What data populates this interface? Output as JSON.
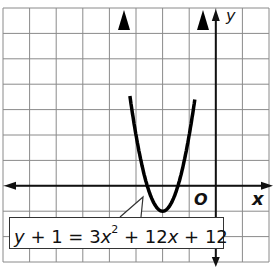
{
  "chart_data": {
    "type": "line",
    "title": "",
    "xlabel": "x",
    "ylabel": "y",
    "origin_label": "O",
    "equation": "y + 1 = 3x^2 + 12x + 12",
    "function": "y = 3x^2 + 12x + 11",
    "vertex": [
      -2,
      -1
    ],
    "xlim": [
      -8,
      2
    ],
    "ylim": [
      -3,
      7
    ],
    "grid": true,
    "x": [
      -3.2,
      -3,
      -2.5,
      -2,
      -1.5,
      -1,
      -0.8
    ],
    "y": [
      3.32,
      2,
      -0.25,
      -1,
      -0.25,
      2,
      3.32
    ],
    "axis_color": "#111111",
    "curve_color": "#000000",
    "grid_color": "#8a8a8a"
  },
  "labels": {
    "x_axis": "x",
    "y_axis": "y",
    "origin": "O",
    "eq_left": "y + 1 = 3",
    "eq_x": "x",
    "eq_exp": "2",
    "eq_rest1": " + 12",
    "eq_x2": "x",
    "eq_rest2": " + 12"
  }
}
